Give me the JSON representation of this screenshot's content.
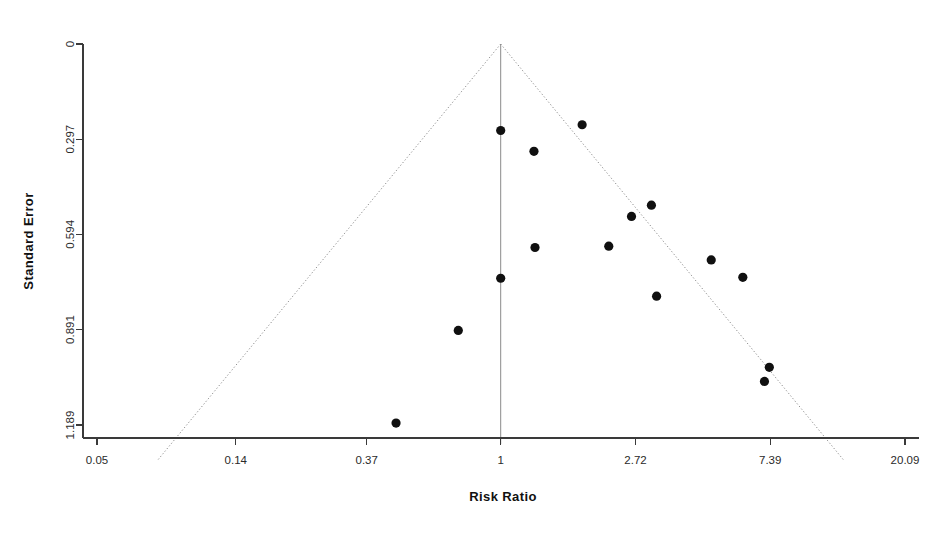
{
  "chart_data": {
    "type": "scatter",
    "title": "",
    "subtitle": "",
    "xlabel": "Risk Ratio",
    "ylabel": "Standard Error",
    "x_scale": "log",
    "x_ticks": [
      0.05,
      0.14,
      0.37,
      1,
      2.72,
      7.39,
      20.09
    ],
    "x_tick_labels": [
      "0.05",
      "0.14",
      "0.37",
      "1",
      "2.72",
      "7.39",
      "20.09"
    ],
    "xlim": [
      0.05,
      20.09
    ],
    "y_ticks": [
      0,
      0.297,
      0.594,
      0.891,
      1.189
    ],
    "y_tick_labels": [
      "0",
      "0.297",
      "0.594",
      "0.891",
      "1.189"
    ],
    "ylim": [
      0,
      1.189
    ],
    "y_inverted": true,
    "grid": false,
    "legend": null,
    "annotations": [],
    "reference_line": {
      "name": "pooled-effect-line",
      "x": 1.0,
      "style": "solid",
      "color": "#8b8b8b"
    },
    "funnel_bounds": {
      "name": "pseudo-95-confidence-limits",
      "apex_x": 1.0,
      "apex_y": 0,
      "slope_z": 1.96,
      "style": "dotted",
      "color": "#8b8b8b"
    },
    "point_color": "#101010",
    "point_radius": 4.6,
    "n_points": 15,
    "x": [
      1.0,
      1.28,
      1.83,
      3.06,
      2.64,
      1.29,
      2.23,
      4.77,
      6.03,
      1.0,
      3.18,
      0.73,
      7.34,
      7.08,
      0.46
    ],
    "y": [
      0.27,
      0.335,
      0.252,
      0.503,
      0.538,
      0.635,
      0.631,
      0.674,
      0.728,
      0.731,
      0.787,
      0.894,
      1.009,
      1.053,
      1.183
    ],
    "points": [
      {
        "risk_ratio": 1.0,
        "standard_error": 0.27
      },
      {
        "risk_ratio": 1.28,
        "standard_error": 0.335
      },
      {
        "risk_ratio": 1.83,
        "standard_error": 0.252
      },
      {
        "risk_ratio": 3.06,
        "standard_error": 0.503
      },
      {
        "risk_ratio": 2.64,
        "standard_error": 0.538
      },
      {
        "risk_ratio": 1.29,
        "standard_error": 0.635
      },
      {
        "risk_ratio": 2.23,
        "standard_error": 0.631
      },
      {
        "risk_ratio": 4.77,
        "standard_error": 0.674
      },
      {
        "risk_ratio": 6.03,
        "standard_error": 0.728
      },
      {
        "risk_ratio": 1.0,
        "standard_error": 0.731
      },
      {
        "risk_ratio": 3.18,
        "standard_error": 0.787
      },
      {
        "risk_ratio": 0.73,
        "standard_error": 0.894
      },
      {
        "risk_ratio": 7.34,
        "standard_error": 1.009
      },
      {
        "risk_ratio": 7.08,
        "standard_error": 1.053
      },
      {
        "risk_ratio": 0.46,
        "standard_error": 1.183
      }
    ]
  }
}
